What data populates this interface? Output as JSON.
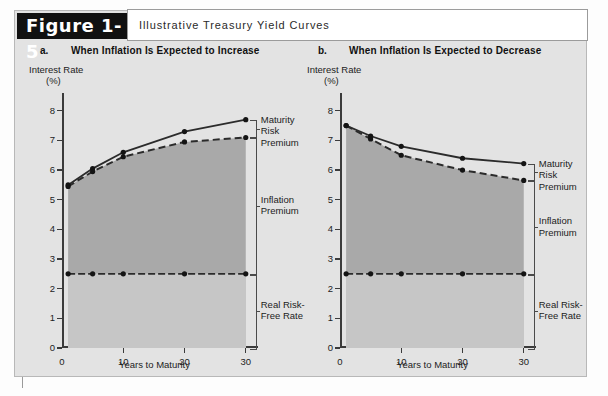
{
  "figure": {
    "tag": "Figure 1-5",
    "title": "Illustrative Treasury Yield Curves"
  },
  "panels": [
    {
      "letter": "a.",
      "heading": "When Inflation Is Expected to Increase",
      "y_axis_title_line1": "Interest Rate",
      "y_axis_title_line2": "(%)",
      "x_axis_label": "Years to Maturity",
      "annotations": {
        "maturity_risk_premium": "Maturity\nRisk\nPremium",
        "maturity_risk_premium_l1": "Maturity",
        "maturity_risk_premium_l2": "Risk",
        "maturity_risk_premium_l3": "Premium",
        "inflation_premium_l1": "Inflation",
        "inflation_premium_l2": "Premium",
        "real_risk_free_l1": "Real Risk-",
        "real_risk_free_l2": "Free Rate"
      }
    },
    {
      "letter": "b.",
      "heading": "When Inflation Is Expected to Decrease",
      "y_axis_title_line1": "Interest Rate",
      "y_axis_title_line2": "(%)",
      "x_axis_label": "Years to Maturity",
      "annotations": {
        "maturity_risk_premium_l1": "Maturity",
        "maturity_risk_premium_l2": "Risk",
        "maturity_risk_premium_l3": "Premium",
        "inflation_premium_l1": "Inflation",
        "inflation_premium_l2": "Premium",
        "real_risk_free_l1": "Real Risk-",
        "real_risk_free_l2": "Free Rate"
      }
    }
  ],
  "chart_data": [
    {
      "type": "line",
      "title": "a. When Inflation Is Expected to Increase",
      "xlabel": "Years to Maturity",
      "ylabel": "Interest Rate (%)",
      "xlim": [
        0,
        32
      ],
      "ylim": [
        0,
        8.6
      ],
      "xticks": [
        0,
        10,
        20,
        30
      ],
      "yticks": [
        0,
        1,
        2,
        3,
        4,
        5,
        6,
        7,
        8
      ],
      "grid": false,
      "legend": "none",
      "x": [
        1,
        5,
        10,
        20,
        30
      ],
      "series": [
        {
          "name": "Nominal Treasury yield (total)",
          "style": "solid",
          "values": [
            5.5,
            6.05,
            6.6,
            7.3,
            7.7
          ]
        },
        {
          "name": "Real risk-free rate + inflation premium",
          "style": "dashed",
          "values": [
            5.45,
            5.95,
            6.45,
            6.95,
            7.1
          ]
        },
        {
          "name": "Real risk-free rate",
          "style": "dash-dot",
          "values": [
            2.5,
            2.5,
            2.5,
            2.5,
            2.5
          ]
        }
      ],
      "bands": [
        {
          "name": "Inflation Premium",
          "from": 2.5,
          "to": "dashed-series",
          "shade": "#a9a9a9"
        },
        {
          "name": "Real Risk-Free Rate",
          "from": 0,
          "to": 2.5,
          "shade": "#c6c6c6"
        }
      ],
      "annotations": [
        {
          "label": "Maturity Risk Premium",
          "span_from": 7.1,
          "span_to": 7.7
        },
        {
          "label": "Inflation Premium",
          "span_from": 2.5,
          "span_to": 7.1
        },
        {
          "label": "Real Risk-Free Rate",
          "span_from": 0,
          "span_to": 2.5
        }
      ]
    },
    {
      "type": "line",
      "title": "b. When Inflation Is Expected to Decrease",
      "xlabel": "Years to Maturity",
      "ylabel": "Interest Rate (%)",
      "xlim": [
        0,
        32
      ],
      "ylim": [
        0,
        8.6
      ],
      "xticks": [
        0,
        10,
        20,
        30
      ],
      "yticks": [
        0,
        1,
        2,
        3,
        4,
        5,
        6,
        7,
        8
      ],
      "grid": false,
      "legend": "none",
      "x": [
        1,
        5,
        10,
        20,
        30
      ],
      "series": [
        {
          "name": "Nominal Treasury yield (total)",
          "style": "solid",
          "values": [
            7.5,
            7.15,
            6.8,
            6.4,
            6.22
          ]
        },
        {
          "name": "Real risk-free rate + inflation premium",
          "style": "dashed",
          "values": [
            7.5,
            7.05,
            6.5,
            6.0,
            5.65
          ]
        },
        {
          "name": "Real risk-free rate",
          "style": "dash-dot",
          "values": [
            2.5,
            2.5,
            2.5,
            2.5,
            2.5
          ]
        }
      ],
      "bands": [
        {
          "name": "Inflation Premium",
          "from": 2.5,
          "to": "dashed-series",
          "shade": "#a9a9a9"
        },
        {
          "name": "Real Risk-Free Rate",
          "from": 0,
          "to": 2.5,
          "shade": "#c6c6c6"
        }
      ],
      "annotations": [
        {
          "label": "Maturity Risk Premium",
          "span_from": 5.65,
          "span_to": 6.22
        },
        {
          "label": "Inflation Premium",
          "span_from": 2.5,
          "span_to": 5.65
        },
        {
          "label": "Real Risk-Free Rate",
          "span_from": 0,
          "span_to": 2.5
        }
      ]
    }
  ],
  "colors": {
    "panel_background": "#e3e3e3",
    "tag_background": "#111111",
    "tag_text": "#ffffff",
    "inflation_band": "#a9a9a9",
    "real_band": "#c6c6c6",
    "axis": "#3b3b3b",
    "line": "#2b2b2b"
  }
}
